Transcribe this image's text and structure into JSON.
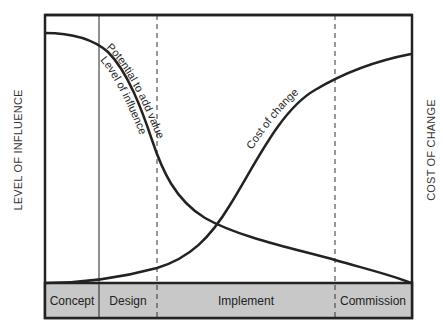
{
  "diagram": {
    "left_axis_label": "LEVEL OF INFLUENCE",
    "right_axis_label": "COST OF CHANGE",
    "curves": {
      "influence_label_1": "Potential to add value",
      "influence_label_2": "Level of influence",
      "cost_label": "Cost of change"
    },
    "phases": [
      {
        "label": "Concept"
      },
      {
        "label": "Design"
      },
      {
        "label": "Implement"
      },
      {
        "label": "Commission"
      }
    ],
    "colors": {
      "phase_bar": "#c8c8c8",
      "line": "#222222"
    }
  }
}
